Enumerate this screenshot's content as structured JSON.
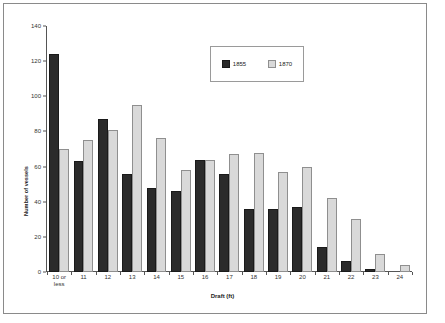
{
  "chart_data": {
    "type": "bar",
    "title": "",
    "xlabel": "Draft (ft)",
    "ylabel": "Number of vessels",
    "categories": [
      "10 or\nless",
      "11",
      "12",
      "13",
      "14",
      "15",
      "16",
      "17",
      "18",
      "19",
      "20",
      "21",
      "22",
      "23",
      "24"
    ],
    "series": [
      {
        "name": "1855",
        "color": "#2b2b2b",
        "values": [
          124,
          63,
          87,
          56,
          48,
          46,
          64,
          56,
          36,
          36,
          37,
          14,
          6,
          2,
          0
        ]
      },
      {
        "name": "1870",
        "color": "#d9d9d9",
        "values": [
          70,
          75,
          81,
          95,
          76,
          58,
          64,
          67,
          68,
          57,
          60,
          42,
          30,
          10,
          4
        ]
      }
    ],
    "ylim": [
      0,
      140
    ],
    "yticks": [
      0,
      20,
      40,
      60,
      80,
      100,
      120,
      140
    ],
    "grid": false,
    "legend_position": "top-center"
  },
  "legend": {
    "items": [
      {
        "label": "1855"
      },
      {
        "label": "1870"
      }
    ]
  },
  "axes": {
    "y_title": "Number of vessels",
    "x_title": "Draft (ft)"
  }
}
